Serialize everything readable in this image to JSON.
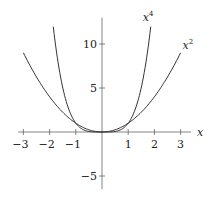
{
  "chart_data": {
    "type": "line",
    "title": "",
    "xlabel": "x",
    "ylabel": "",
    "xlim": [
      -3.2,
      3.4
    ],
    "ylim": [
      -6.5,
      13
    ],
    "grid": false,
    "legend": "inline labels at curve ends",
    "x_ticks": [
      -3,
      -2,
      -1,
      1,
      2,
      3
    ],
    "x_tick_labels": [
      "−3",
      "−2",
      "−1",
      "1",
      "2",
      "3"
    ],
    "y_ticks": [
      -5,
      5,
      10
    ],
    "y_tick_labels": [
      "−5",
      "5",
      "10"
    ],
    "series": [
      {
        "name": "x^2",
        "label": "x",
        "sup": "2",
        "domain": [
          -3,
          3
        ],
        "color": "#333333",
        "x": [
          -3,
          -2,
          -1,
          0,
          1,
          2,
          3
        ],
        "values": [
          9,
          4,
          1,
          0,
          1,
          4,
          9
        ]
      },
      {
        "name": "x^4",
        "label": "x",
        "sup": "4",
        "domain": [
          -1.86,
          1.86
        ],
        "color": "#333333",
        "x": [
          -1.86,
          -1.5,
          -1,
          -0.5,
          0,
          0.5,
          1,
          1.5,
          1.86
        ],
        "values": [
          11.97,
          5.06,
          1,
          0.06,
          0,
          0.06,
          1,
          5.06,
          11.97
        ]
      }
    ]
  }
}
